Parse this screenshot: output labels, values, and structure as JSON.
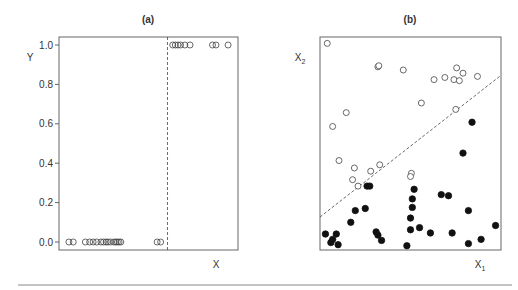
{
  "chart_data": [
    {
      "panel": "(a)",
      "type": "scatter",
      "title": "(a)",
      "xlabel": "X",
      "ylabel": "Y",
      "ylim": [
        -0.02,
        1.04
      ],
      "xlim": [
        0,
        1
      ],
      "yticks": [
        "0.0",
        "0.2",
        "0.4",
        "0.6",
        "0.8",
        "1.0"
      ],
      "ytick_values": [
        0.0,
        0.2,
        0.4,
        0.6,
        0.8,
        1.0
      ],
      "xticks": [],
      "grid": false,
      "legend": null,
      "threshold": {
        "x": 0.61,
        "style": "dashed",
        "label": ""
      },
      "series": [
        {
          "name": "Y = 0",
          "marker": "open-circle",
          "x": [
            0.04,
            0.065,
            0.135,
            0.16,
            0.18,
            0.2,
            0.225,
            0.24,
            0.255,
            0.265,
            0.28,
            0.3,
            0.31,
            0.32,
            0.33,
            0.34,
            0.55,
            0.57
          ],
          "y": [
            0,
            0,
            0,
            0,
            0,
            0,
            0,
            0,
            0,
            0,
            0,
            0,
            0,
            0,
            0,
            0,
            0,
            0
          ]
        },
        {
          "name": "Y = 1",
          "marker": "open-circle",
          "x": [
            0.64,
            0.655,
            0.67,
            0.685,
            0.71,
            0.74,
            0.87,
            0.89,
            0.96
          ],
          "y": [
            1,
            1,
            1,
            1,
            1,
            1,
            1,
            1,
            1
          ]
        }
      ]
    },
    {
      "panel": "(b)",
      "type": "scatter",
      "title": "(b)",
      "xlabel": "X1",
      "ylabel": "X2",
      "xlim": [
        0,
        1
      ],
      "ylim": [
        0,
        1
      ],
      "xticks": [],
      "yticks": [],
      "grid": false,
      "legend": null,
      "decision_boundary": {
        "x": [
          0,
          1
        ],
        "y": [
          0.155,
          0.82
        ],
        "style": "dashed"
      },
      "series": [
        {
          "name": "class 0 (open)",
          "marker": "open-circle",
          "x": [
            0.04,
            0.32,
            0.325,
            0.46,
            0.63,
            0.69,
            0.74,
            0.755,
            0.77,
            0.79,
            0.87,
            0.56,
            0.145,
            0.07,
            0.33,
            0.505,
            0.5,
            0.105,
            0.19,
            0.28,
            0.18,
            0.21,
            0.75
          ],
          "y": [
            0.97,
            0.86,
            0.865,
            0.845,
            0.8,
            0.81,
            0.8,
            0.855,
            0.795,
            0.83,
            0.815,
            0.69,
            0.645,
            0.58,
            0.4,
            0.36,
            0.345,
            0.42,
            0.385,
            0.37,
            0.33,
            0.3,
            0.66
          ]
        },
        {
          "name": "class 1 (filled)",
          "marker": "filled-circle",
          "x": [
            0.84,
            0.79,
            0.52,
            0.51,
            0.51,
            0.5,
            0.5,
            0.55,
            0.67,
            0.71,
            0.82,
            0.61,
            0.73,
            0.97,
            0.26,
            0.275,
            0.25,
            0.195,
            0.17,
            0.09,
            0.03,
            0.07,
            0.06,
            0.31,
            0.32,
            0.34,
            0.1,
            0.48,
            0.82,
            0.89
          ],
          "y": [
            0.6,
            0.455,
            0.285,
            0.24,
            0.2,
            0.15,
            0.095,
            0.105,
            0.26,
            0.255,
            0.185,
            0.08,
            0.08,
            0.115,
            0.3,
            0.3,
            0.195,
            0.185,
            0.13,
            0.075,
            0.075,
            0.05,
            0.035,
            0.085,
            0.07,
            0.045,
            0.025,
            0.02,
            0.03,
            0.05
          ]
        }
      ]
    }
  ]
}
